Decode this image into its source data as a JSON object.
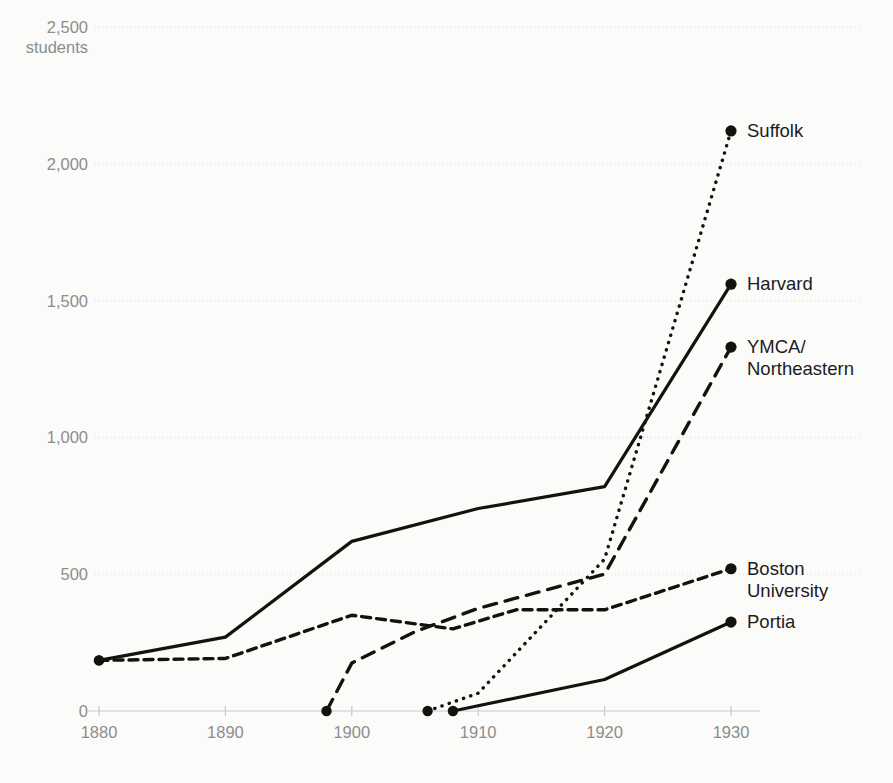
{
  "chart_data": {
    "type": "line",
    "title": "",
    "subtitle": "",
    "xlabel": "",
    "ylabel": "students",
    "yunit_label": "students",
    "xlim": [
      1880,
      1930
    ],
    "ylim": [
      0,
      2500
    ],
    "grid": true,
    "legend_position": "right-inline-at-series-end",
    "xticks": [
      "1880",
      "1890",
      "1900",
      "1910",
      "1920",
      "1930"
    ],
    "xtick_values": [
      1880,
      1890,
      1900,
      1910,
      1920,
      1930
    ],
    "yticks": [
      "0",
      "500",
      "1,000",
      "1,500",
      "2,000",
      "2,500"
    ],
    "ytick_values": [
      0,
      500,
      1000,
      1500,
      2000,
      2500
    ],
    "series": [
      {
        "name": "Suffolk",
        "label": "Suffolk",
        "style": "dotted",
        "x": [
          1906,
          1910,
          1920,
          1930
        ],
        "values": [
          0,
          65,
          555,
          2120
        ]
      },
      {
        "name": "Harvard",
        "label": "Harvard",
        "style": "solid",
        "x": [
          1880,
          1890,
          1900,
          1910,
          1920,
          1930
        ],
        "values": [
          185,
          270,
          620,
          740,
          820,
          1560
        ]
      },
      {
        "name": "YMCA/Northeastern",
        "label": "YMCA/\nNortheastern",
        "label_line1": "YMCA/",
        "label_line2": "Northeastern",
        "style": "dashed",
        "x": [
          1898,
          1900,
          1905,
          1910,
          1920,
          1930
        ],
        "values": [
          0,
          175,
          290,
          375,
          500,
          1330
        ]
      },
      {
        "name": "Boston University",
        "label": "Boston\nUniversity",
        "label_line1": "Boston",
        "label_line2": "University",
        "style": "dashed-short",
        "x": [
          1880,
          1890,
          1900,
          1908,
          1913,
          1920,
          1930
        ],
        "values": [
          185,
          192,
          350,
          300,
          370,
          370,
          520
        ]
      },
      {
        "name": "Portia",
        "label": "Portia",
        "style": "solid",
        "x": [
          1908,
          1920,
          1930
        ],
        "values": [
          0,
          115,
          325
        ]
      }
    ]
  },
  "axis": {
    "y_top_value": "2,500",
    "y_unit": "students"
  }
}
